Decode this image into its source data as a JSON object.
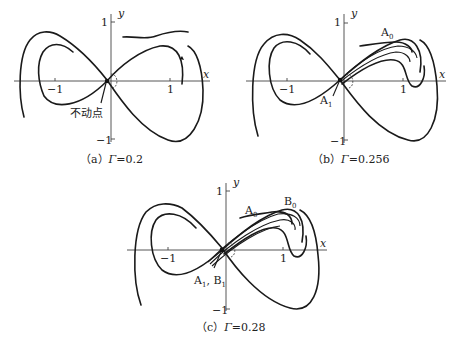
{
  "panels": [
    {
      "id": "a",
      "caption_prefix": "（a）",
      "caption_symbol": "Γ",
      "caption_value": "=0.2",
      "axis_x": "x",
      "axis_y": "y",
      "ticks": {
        "x_neg": "−1",
        "x_pos": "1",
        "y_pos": "1",
        "y_neg": "−1"
      },
      "annotations": [
        {
          "text": "不动点"
        }
      ]
    },
    {
      "id": "b",
      "caption_prefix": "（b）",
      "caption_symbol": "Γ",
      "caption_value": "=0.256",
      "axis_x": "x",
      "axis_y": "y",
      "ticks": {
        "x_neg": "−1",
        "x_pos": "1",
        "y_pos": "1",
        "y_neg": "−1"
      },
      "annotations": [
        {
          "base": "A",
          "sub": "0"
        },
        {
          "base": "A",
          "sub": "1"
        }
      ]
    },
    {
      "id": "c",
      "caption_prefix": "（c）",
      "caption_symbol": "Γ",
      "caption_value": "=0.28",
      "axis_x": "x",
      "axis_y": "y",
      "ticks": {
        "x_neg": "−1",
        "x_pos": "1",
        "y_pos": "1",
        "y_neg": "−1"
      },
      "annotations": [
        {
          "base": "A",
          "sub": "0"
        },
        {
          "base": "B",
          "sub": "0"
        },
        {
          "base": "A",
          "sub": "1",
          "sep": ", ",
          "base2": "B",
          "sub2": "1"
        }
      ]
    }
  ]
}
